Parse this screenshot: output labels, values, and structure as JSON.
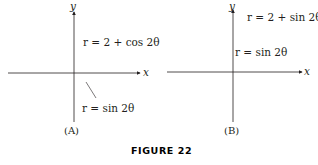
{
  "figure": {
    "title": "FIGURE 22",
    "title_color": "#e8457e"
  },
  "colors": {
    "outer_fill": "#fbd9bd",
    "outer_stroke": "#4a7ab0",
    "inner_stroke": "#d93a6a",
    "inner_fill": "#ffffff",
    "axis": "#231f20"
  },
  "panels": [
    {
      "id": "A",
      "caption": "(A)",
      "x_label": "x",
      "y_label": "y",
      "outer_curve": {
        "label": "r = 2 + cos 2θ",
        "equation": "2+cos(2t)"
      },
      "inner_curve": {
        "label": "r = sin 2θ",
        "equation": "sin(2t)"
      }
    },
    {
      "id": "B",
      "caption": "(B)",
      "x_label": "x",
      "y_label": "y",
      "outer_curve": {
        "label": "r = 2 + sin 2θ",
        "equation": "2+sin(2t)"
      },
      "inner_curve": {
        "label": "r = sin 2θ",
        "equation": "sin(2t)"
      }
    }
  ]
}
